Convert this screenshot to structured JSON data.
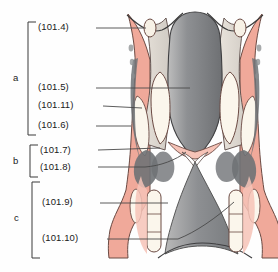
{
  "figure": {
    "type": "anatomical-illustration",
    "background_color": "#fefefe",
    "palette": {
      "mucosa_pink": "#f0a99a",
      "mucosa_pink_light": "#f6c3b7",
      "cartilage_cream": "#f7f1e6",
      "muscle_grey": "#6f7275",
      "cartilage_grey": "#9a9a9a",
      "epiglottis_grey": "#8f9093",
      "outline": "#4a3b38",
      "label_text": "#1a1a1a",
      "leader_line": "#4a4a4a",
      "bracket": "#3a3a3a"
    }
  },
  "brackets": [
    {
      "letter": "a",
      "letter_y": 78,
      "top": 22,
      "bottom": 135
    },
    {
      "letter": "b",
      "letter_y": 161,
      "top": 145,
      "bottom": 177
    },
    {
      "letter": "c",
      "letter_y": 218,
      "top": 182,
      "bottom": 258
    }
  ],
  "labels": [
    {
      "id": "101.4",
      "text": "(101.4)",
      "x": 38,
      "y": 28,
      "leader_from_x": 96,
      "leader_to_x": 150,
      "leader_to_y": 28
    },
    {
      "id": "101.5",
      "text": "(101.5)",
      "x": 38,
      "y": 88,
      "leader_from_x": 96,
      "leader_to_x": 190,
      "leader_to_y": 88
    },
    {
      "id": "101.11",
      "text": "(101.11)",
      "x": 38,
      "y": 106,
      "leader_from_x": 103,
      "leader_to_x": 142,
      "leader_to_y": 108
    },
    {
      "id": "101.6",
      "text": "(101.6)",
      "x": 38,
      "y": 126,
      "leader_from_x": 96,
      "leader_to_x": 131,
      "leader_to_y": 126
    },
    {
      "id": "101.7",
      "text": "(101.7)",
      "x": 40,
      "y": 153,
      "leader_from_x": 98,
      "leader_to_x": 160,
      "leader_to_y": 149
    },
    {
      "id": "101.8",
      "text": "(101.8)",
      "x": 40,
      "y": 170,
      "leader_from_x": 98,
      "leader_to_x": 172,
      "leader_to_y": 166
    },
    {
      "id": "101.9",
      "text": "(101.9)",
      "x": 42,
      "y": 203,
      "leader_from_x": 100,
      "leader_to_x": 168,
      "leader_to_y": 203
    },
    {
      "id": "101.10",
      "text": "(101.10)",
      "x": 42,
      "y": 239,
      "leader_from_x": 107,
      "leader_to_x": 178,
      "leader_to_y": 239
    }
  ]
}
